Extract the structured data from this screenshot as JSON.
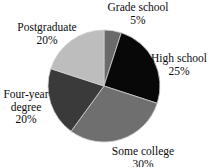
{
  "chart_data": {
    "type": "pie",
    "title": "",
    "subtitle": "",
    "xlabel": "",
    "ylabel": "",
    "legend_position": "none",
    "grid": false,
    "labels_outside": true,
    "start_angle_deg": 0,
    "direction": "clockwise",
    "categories": [
      "Grade school",
      "High school",
      "Some college",
      "Four-year degree",
      "Postgraduate"
    ],
    "values": [
      5,
      25,
      30,
      20,
      20
    ],
    "value_suffix": "%",
    "colors": [
      "#6a6a6a",
      "#080808",
      "#6f6f6f",
      "#3a3a3a",
      "#bdbdbd"
    ],
    "slices": [
      {
        "label": "Grade school",
        "value": 5,
        "value_text": "5%",
        "color": "#6a6a6a",
        "start_deg": 0,
        "end_deg": 18
      },
      {
        "label": "High school",
        "value": 25,
        "value_text": "25%",
        "color": "#080808",
        "start_deg": 18,
        "end_deg": 108
      },
      {
        "label": "Some college",
        "value": 30,
        "value_text": "30%",
        "color": "#6f6f6f",
        "start_deg": 108,
        "end_deg": 216
      },
      {
        "label": "Four-year degree",
        "value": 20,
        "value_text": "20%",
        "color": "#3a3a3a",
        "start_deg": 216,
        "end_deg": 288
      },
      {
        "label": "Postgraduate",
        "value": 20,
        "value_text": "20%",
        "color": "#bdbdbd",
        "start_deg": 288,
        "end_deg": 360
      }
    ]
  },
  "labels": {
    "grade_school": {
      "name": "Grade school",
      "percent": "5%"
    },
    "high_school": {
      "name": "High school",
      "percent": "25%"
    },
    "some_college": {
      "name": "Some college",
      "percent": "30%"
    },
    "four_year_degree": {
      "name_line1": "Four-year",
      "name_line2": "degree",
      "percent": "20%"
    },
    "postgraduate": {
      "name": "Postgraduate",
      "percent": "20%"
    }
  },
  "style": {
    "background": "#ffffff",
    "text_color": "#0b0b0b",
    "slice_stroke": "#cfcfcf"
  }
}
